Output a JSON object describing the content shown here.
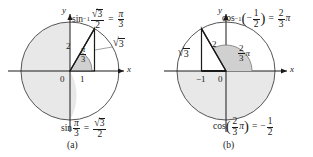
{
  "figure": {
    "background_color": "#ffffff",
    "ink_color": "#1a1a1a",
    "shade_color": "#e8e8e8",
    "arc_shade_color": "#d0d0d0"
  },
  "panel_a": {
    "caption": "(a)",
    "axis_x_label": "x",
    "axis_y_label": "y",
    "origin_label": "0",
    "base_label": "1",
    "hypotenuse_label": "2",
    "vertical_leg_label": {
      "radical": "√",
      "radicand": "3"
    },
    "angle_label": {
      "num": "π",
      "den": "3"
    },
    "top_equation": {
      "function": "sin",
      "exponent": "−1",
      "arg_num": {
        "radical": "√",
        "radicand": "3"
      },
      "arg_den": "2",
      "equals": "=",
      "result_num": "π",
      "result_den": "3"
    },
    "bottom_equation": {
      "function": "sin",
      "arg_num": "π",
      "arg_den": "3",
      "equals": "=",
      "result_num": {
        "radical": "√",
        "radicand": "3"
      },
      "result_den": "2"
    }
  },
  "panel_b": {
    "caption": "(b)",
    "axis_x_label": "x",
    "axis_y_label": "y",
    "origin_label": "0",
    "base_label": "−1",
    "hypotenuse_label": "2",
    "vertical_leg_label": {
      "radical": "√",
      "radicand": "3"
    },
    "angle_label": {
      "num": "2",
      "den": "3",
      "pi": "π"
    },
    "top_equation": {
      "function": "cos",
      "exponent": "−1",
      "open_paren": "(",
      "sign": "−",
      "arg_num": "1",
      "arg_den": "2",
      "close_paren": ")",
      "equals": "=",
      "result_num": "2",
      "result_den": "3",
      "result_pi": "π"
    },
    "bottom_equation": {
      "function": "cos",
      "open_paren": "(",
      "arg_num": "2",
      "arg_den": "3",
      "arg_pi": "π",
      "close_paren": ")",
      "equals": "=",
      "sign": "−",
      "result_num": "1",
      "result_den": "2"
    }
  }
}
